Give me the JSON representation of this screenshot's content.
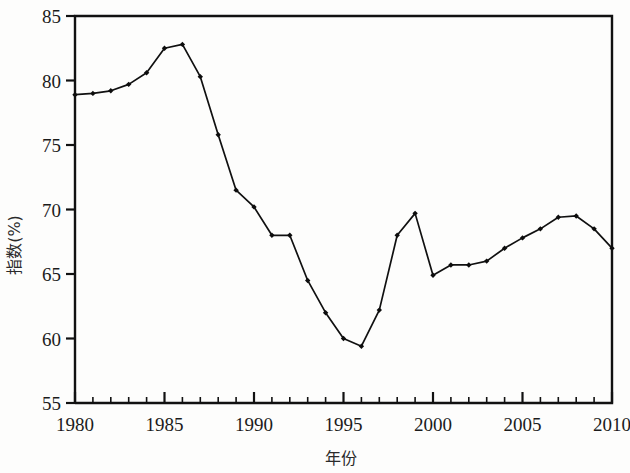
{
  "chart_data": {
    "type": "line",
    "title": "",
    "subtitle": "",
    "xlabel": "年份",
    "ylabel": "指数(%)",
    "xlim": [
      1980,
      2010
    ],
    "ylim": [
      55,
      85
    ],
    "grid": false,
    "legend": null,
    "legend_position": "none",
    "x_major_ticks": [
      1980,
      1985,
      1990,
      1995,
      2000,
      2005,
      2010
    ],
    "x_tick_labels": [
      "1980",
      "1985",
      "1990",
      "1995",
      "2000",
      "2005",
      "2010"
    ],
    "x_minor_tick_step": 1,
    "y_major_ticks": [
      55,
      60,
      65,
      70,
      75,
      80,
      85
    ],
    "y_tick_labels": [
      "55",
      "60",
      "65",
      "70",
      "75",
      "80",
      "85"
    ],
    "marker": "filled-diamond",
    "line_color": "#101010",
    "x": [
      1980,
      1981,
      1982,
      1983,
      1984,
      1985,
      1986,
      1987,
      1988,
      1989,
      1990,
      1991,
      1992,
      1993,
      1994,
      1995,
      1996,
      1997,
      1998,
      1999,
      2000,
      2001,
      2002,
      2003,
      2004,
      2005,
      2006,
      2007,
      2008,
      2009,
      2010
    ],
    "values": [
      78.9,
      79.0,
      79.2,
      79.7,
      80.6,
      82.5,
      82.8,
      80.3,
      75.8,
      71.5,
      70.2,
      68.0,
      68.0,
      64.5,
      62.0,
      60.0,
      59.4,
      62.2,
      68.0,
      69.7,
      64.9,
      65.7,
      65.7,
      66.0,
      67.0,
      67.8,
      68.5,
      69.4,
      69.5,
      68.5,
      67.0
    ],
    "series": [
      {
        "name": "指数(%)",
        "values": [
          78.9,
          79.0,
          79.2,
          79.7,
          80.6,
          82.5,
          82.8,
          80.3,
          75.8,
          71.5,
          70.2,
          68.0,
          68.0,
          64.5,
          62.0,
          60.0,
          59.4,
          62.2,
          68.0,
          69.7,
          64.9,
          65.7,
          65.7,
          66.0,
          67.0,
          67.8,
          68.5,
          69.4,
          69.5,
          68.5,
          67.0
        ]
      }
    ]
  }
}
